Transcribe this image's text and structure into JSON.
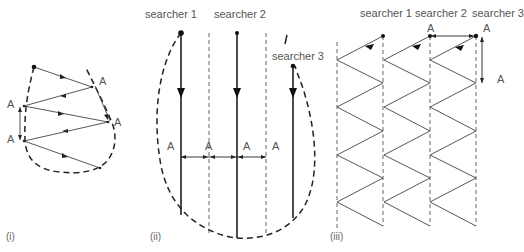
{
  "panels": {
    "i": {
      "caption": "(i)",
      "labels": [
        "A",
        "A",
        "A",
        "A"
      ]
    },
    "ii": {
      "caption": "(ii)",
      "searchers": [
        "searcher 1",
        "searcher 2",
        "searcher 3"
      ],
      "labels": [
        "A",
        "A",
        "A",
        "A"
      ]
    },
    "iii": {
      "caption": "(iii)",
      "searchers": [
        "searcher 1",
        "searcher 2",
        "searcher 3"
      ],
      "labels": [
        "A",
        "A",
        "A"
      ]
    }
  },
  "colors": {
    "line": "#222222",
    "thin_line": "#444444",
    "text": "#555555",
    "background": "#ffffff"
  }
}
